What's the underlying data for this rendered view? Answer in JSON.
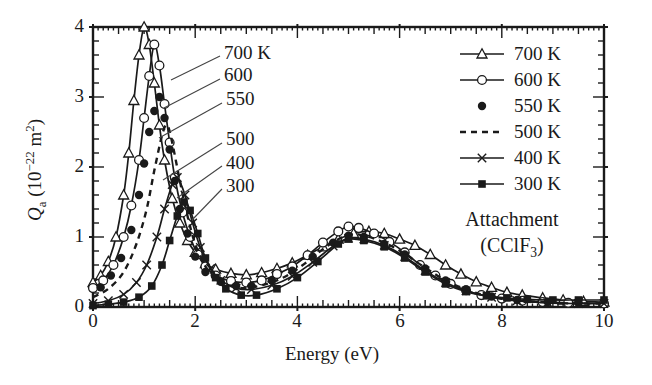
{
  "figure": {
    "background": "#ffffff",
    "ink": "#1a1a1a",
    "leader_line_color": "#444444"
  },
  "chart_data": {
    "type": "line",
    "title": "",
    "xlabel": "Energy (eV)",
    "ylabel": "Qa (10^-22 m^2)",
    "xlim": [
      0,
      10
    ],
    "ylim": [
      0,
      4
    ],
    "grid": false,
    "legend_position": "upper-right-inside",
    "x_tick_labels": [
      "0",
      "2",
      "4",
      "6",
      "8",
      "10"
    ],
    "x_major_values": [
      0,
      2,
      4,
      6,
      8,
      10
    ],
    "x_medium_step": 0.5,
    "x_minor_step": 0.1,
    "y_tick_labels": [
      "0",
      "1",
      "2",
      "3",
      "4"
    ],
    "y_major_values": [
      0,
      1,
      2,
      3,
      4
    ],
    "y_minor_step": 0.2,
    "series": [
      {
        "name": "700 K",
        "marker": "triangle-open",
        "line": "solid",
        "points": [
          [
            0,
            0.35
          ],
          [
            0.15,
            0.45
          ],
          [
            0.3,
            0.65
          ],
          [
            0.45,
            1.0
          ],
          [
            0.6,
            1.6
          ],
          [
            0.7,
            2.2
          ],
          [
            0.8,
            2.95
          ],
          [
            0.9,
            3.6
          ],
          [
            1.0,
            4.0
          ],
          [
            1.1,
            3.75
          ],
          [
            1.2,
            3.2
          ],
          [
            1.3,
            2.6
          ],
          [
            1.4,
            2.1
          ],
          [
            1.55,
            1.55
          ],
          [
            1.7,
            1.2
          ],
          [
            1.85,
            0.95
          ],
          [
            2.0,
            0.78
          ],
          [
            2.2,
            0.62
          ],
          [
            2.4,
            0.54
          ],
          [
            2.7,
            0.48
          ],
          [
            3.0,
            0.46
          ],
          [
            3.3,
            0.49
          ],
          [
            3.6,
            0.55
          ],
          [
            3.9,
            0.63
          ],
          [
            4.2,
            0.74
          ],
          [
            4.5,
            0.86
          ],
          [
            4.8,
            0.97
          ],
          [
            5.1,
            1.05
          ],
          [
            5.4,
            1.08
          ],
          [
            5.7,
            1.05
          ],
          [
            6.0,
            0.97
          ],
          [
            6.3,
            0.88
          ],
          [
            6.6,
            0.75
          ],
          [
            6.9,
            0.6
          ],
          [
            7.2,
            0.47
          ],
          [
            7.5,
            0.36
          ],
          [
            7.8,
            0.28
          ],
          [
            8.1,
            0.21
          ],
          [
            8.4,
            0.17
          ],
          [
            8.8,
            0.13
          ],
          [
            9.2,
            0.1
          ],
          [
            9.6,
            0.08
          ],
          [
            10,
            0.07
          ]
        ]
      },
      {
        "name": "600 K",
        "marker": "circle-open",
        "line": "solid",
        "points": [
          [
            0,
            0.27
          ],
          [
            0.2,
            0.38
          ],
          [
            0.4,
            0.6
          ],
          [
            0.6,
            1.0
          ],
          [
            0.75,
            1.45
          ],
          [
            0.9,
            2.1
          ],
          [
            1.0,
            2.7
          ],
          [
            1.1,
            3.3
          ],
          [
            1.2,
            3.75
          ],
          [
            1.3,
            3.45
          ],
          [
            1.4,
            2.9
          ],
          [
            1.5,
            2.35
          ],
          [
            1.6,
            1.85
          ],
          [
            1.75,
            1.35
          ],
          [
            1.9,
            1.0
          ],
          [
            2.05,
            0.75
          ],
          [
            2.2,
            0.58
          ],
          [
            2.4,
            0.45
          ],
          [
            2.7,
            0.37
          ],
          [
            3.0,
            0.35
          ],
          [
            3.3,
            0.38
          ],
          [
            3.6,
            0.47
          ],
          [
            3.9,
            0.58
          ],
          [
            4.2,
            0.74
          ],
          [
            4.5,
            0.92
          ],
          [
            4.8,
            1.08
          ],
          [
            5.0,
            1.15
          ],
          [
            5.2,
            1.13
          ],
          [
            5.5,
            1.05
          ],
          [
            5.8,
            0.93
          ],
          [
            6.1,
            0.78
          ],
          [
            6.4,
            0.6
          ],
          [
            6.7,
            0.45
          ],
          [
            7.0,
            0.33
          ],
          [
            7.3,
            0.24
          ],
          [
            7.6,
            0.17
          ],
          [
            8.0,
            0.12
          ],
          [
            8.4,
            0.09
          ],
          [
            8.8,
            0.07
          ],
          [
            9.3,
            0.06
          ],
          [
            10,
            0.05
          ]
        ]
      },
      {
        "name": "550 K",
        "marker": "circle-filled",
        "line": "none",
        "points": [
          [
            0.15,
            0.28
          ],
          [
            0.35,
            0.45
          ],
          [
            0.55,
            0.7
          ],
          [
            0.75,
            1.1
          ],
          [
            0.9,
            1.6
          ],
          [
            1.0,
            2.05
          ],
          [
            1.1,
            2.5
          ],
          [
            1.2,
            2.8
          ],
          [
            1.3,
            3.0
          ],
          [
            1.4,
            2.7
          ],
          [
            1.5,
            2.25
          ],
          [
            1.6,
            1.8
          ],
          [
            1.7,
            1.4
          ],
          [
            1.85,
            1.05
          ],
          [
            2.0,
            0.72
          ],
          [
            2.2,
            0.5
          ],
          [
            2.5,
            0.36
          ],
          [
            2.8,
            0.3
          ],
          [
            3.1,
            0.3
          ],
          [
            3.5,
            0.38
          ],
          [
            3.9,
            0.52
          ],
          [
            4.3,
            0.72
          ],
          [
            4.7,
            0.92
          ],
          [
            5.0,
            1.02
          ],
          [
            5.3,
            1.0
          ],
          [
            5.7,
            0.9
          ],
          [
            6.1,
            0.75
          ],
          [
            6.5,
            0.55
          ],
          [
            6.9,
            0.38
          ],
          [
            7.3,
            0.25
          ],
          [
            7.8,
            0.15
          ],
          [
            8.3,
            0.1
          ],
          [
            8.9,
            0.07
          ],
          [
            9.5,
            0.06
          ]
        ]
      },
      {
        "name": "500 K",
        "marker": "none",
        "line": "dashed",
        "points": [
          [
            0,
            0.14
          ],
          [
            0.3,
            0.26
          ],
          [
            0.6,
            0.5
          ],
          [
            0.85,
            0.9
          ],
          [
            1.05,
            1.4
          ],
          [
            1.2,
            1.95
          ],
          [
            1.35,
            2.45
          ],
          [
            1.45,
            2.6
          ],
          [
            1.55,
            2.35
          ],
          [
            1.7,
            1.8
          ],
          [
            1.85,
            1.3
          ],
          [
            2.0,
            0.9
          ],
          [
            2.2,
            0.58
          ],
          [
            2.45,
            0.38
          ],
          [
            2.7,
            0.3
          ],
          [
            3.0,
            0.27
          ],
          [
            3.4,
            0.33
          ],
          [
            3.8,
            0.45
          ],
          [
            4.2,
            0.65
          ],
          [
            4.6,
            0.88
          ],
          [
            5.0,
            1.03
          ],
          [
            5.3,
            1.02
          ],
          [
            5.7,
            0.92
          ],
          [
            6.1,
            0.76
          ],
          [
            6.5,
            0.56
          ],
          [
            6.9,
            0.38
          ],
          [
            7.3,
            0.25
          ],
          [
            7.7,
            0.16
          ],
          [
            8.2,
            0.1
          ],
          [
            8.8,
            0.07
          ],
          [
            9.4,
            0.05
          ],
          [
            10,
            0.05
          ]
        ]
      },
      {
        "name": "400 K",
        "marker": "x",
        "line": "solid",
        "points": [
          [
            0,
            0.05
          ],
          [
            0.3,
            0.09
          ],
          [
            0.6,
            0.18
          ],
          [
            0.85,
            0.35
          ],
          [
            1.05,
            0.6
          ],
          [
            1.25,
            1.0
          ],
          [
            1.4,
            1.4
          ],
          [
            1.55,
            1.75
          ],
          [
            1.65,
            1.85
          ],
          [
            1.8,
            1.6
          ],
          [
            1.95,
            1.2
          ],
          [
            2.1,
            0.85
          ],
          [
            2.3,
            0.55
          ],
          [
            2.5,
            0.38
          ],
          [
            2.8,
            0.27
          ],
          [
            3.1,
            0.25
          ],
          [
            3.5,
            0.31
          ],
          [
            3.9,
            0.44
          ],
          [
            4.3,
            0.64
          ],
          [
            4.7,
            0.87
          ],
          [
            5.0,
            0.98
          ],
          [
            5.3,
            0.97
          ],
          [
            5.7,
            0.88
          ],
          [
            6.1,
            0.72
          ],
          [
            6.5,
            0.52
          ],
          [
            6.9,
            0.35
          ],
          [
            7.3,
            0.23
          ],
          [
            7.8,
            0.14
          ],
          [
            8.3,
            0.09
          ],
          [
            8.9,
            0.06
          ],
          [
            9.5,
            0.05
          ],
          [
            10,
            0.05
          ]
        ]
      },
      {
        "name": "300 K",
        "marker": "square-filled",
        "line": "solid",
        "points": [
          [
            0,
            0.02
          ],
          [
            0.3,
            0.04
          ],
          [
            0.6,
            0.07
          ],
          [
            0.9,
            0.14
          ],
          [
            1.15,
            0.3
          ],
          [
            1.35,
            0.6
          ],
          [
            1.5,
            0.95
          ],
          [
            1.65,
            1.3
          ],
          [
            1.78,
            1.5
          ],
          [
            1.9,
            1.38
          ],
          [
            2.05,
            1.05
          ],
          [
            2.2,
            0.7
          ],
          [
            2.4,
            0.42
          ],
          [
            2.6,
            0.26
          ],
          [
            2.9,
            0.17
          ],
          [
            3.2,
            0.17
          ],
          [
            3.6,
            0.26
          ],
          [
            4.0,
            0.42
          ],
          [
            4.4,
            0.65
          ],
          [
            4.8,
            0.9
          ],
          [
            5.0,
            0.97
          ],
          [
            5.3,
            0.95
          ],
          [
            5.7,
            0.86
          ],
          [
            6.1,
            0.7
          ],
          [
            6.5,
            0.5
          ],
          [
            6.9,
            0.33
          ],
          [
            7.3,
            0.22
          ],
          [
            7.7,
            0.16
          ],
          [
            8.1,
            0.13
          ],
          [
            8.5,
            0.11
          ],
          [
            9.0,
            0.1
          ],
          [
            9.5,
            0.1
          ],
          [
            10,
            0.1
          ]
        ]
      }
    ],
    "curve_labels": [
      {
        "text": "700 K",
        "lx": 224,
        "ly": 42,
        "x1": 220,
        "y1": 56,
        "x2": 171,
        "y2": 80
      },
      {
        "text": "600",
        "lx": 224,
        "ly": 64,
        "x1": 220,
        "y1": 79,
        "x2": 164,
        "y2": 108
      },
      {
        "text": "550",
        "lx": 226,
        "ly": 88,
        "x1": 222,
        "y1": 103,
        "x2": 159,
        "y2": 138
      },
      {
        "text": "500",
        "lx": 226,
        "ly": 128,
        "x1": 222,
        "y1": 143,
        "x2": 163,
        "y2": 180
      },
      {
        "text": "400",
        "lx": 226,
        "ly": 152,
        "x1": 222,
        "y1": 166,
        "x2": 177,
        "y2": 198
      },
      {
        "text": "300",
        "lx": 226,
        "ly": 175,
        "x1": 222,
        "y1": 189,
        "x2": 192,
        "y2": 220
      }
    ]
  },
  "ylabel_parts": {
    "symbol": "Q",
    "symbol_sub": "a",
    "unit_open": " (10",
    "unit_exp": "−22",
    "unit_body": " m",
    "unit_exp2": "2",
    "unit_close": ")"
  },
  "side_annotation": {
    "line1": "Attachment",
    "formula_pre": "(CClF",
    "formula_sub": "3",
    "formula_post": ")"
  }
}
